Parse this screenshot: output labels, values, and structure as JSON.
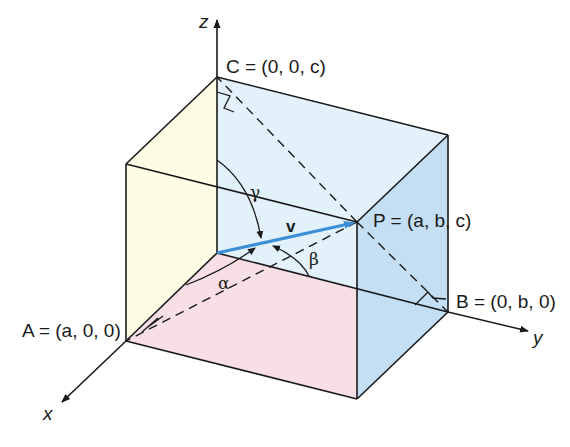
{
  "diagram": {
    "axes": {
      "z_label": "z",
      "x_label": "x",
      "y_label": "y"
    },
    "points": {
      "C": {
        "name": "C",
        "label": "C = (0, 0, c)"
      },
      "A": {
        "name": "A",
        "label": "A = (a, 0, 0)"
      },
      "B": {
        "name": "B",
        "label": "B = (0, b, 0)"
      },
      "P": {
        "name": "P",
        "label": "P = (a, b, c)"
      }
    },
    "vector": {
      "label": "v",
      "color": "#3a8fd6"
    },
    "angles": {
      "alpha": "α",
      "beta": "β",
      "gamma": "γ"
    },
    "faces": {
      "yz_plane_color": "#e3f1fb",
      "xz_plane_color": "#fdfde6",
      "xy_plane_color": "#f8dfe6",
      "front_right_color": "#c4def3"
    }
  }
}
